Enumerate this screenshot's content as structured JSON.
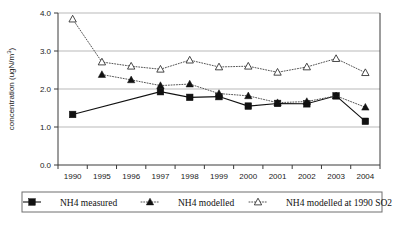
{
  "chart_data": {
    "type": "line",
    "title": "",
    "xlabel": "",
    "ylabel": "concentration (ugN/m",
    "ylabel_sup": "3",
    "ylabel_tail": ")",
    "categories": [
      "1990",
      "1995",
      "1996",
      "1997",
      "1998",
      "1999",
      "2000",
      "2001",
      "2002",
      "2003",
      "2004"
    ],
    "ylim": [
      0.0,
      4.0
    ],
    "yticks": [
      0.0,
      1.0,
      2.0,
      3.0,
      4.0
    ],
    "ytick_labels": [
      "0.0",
      "1.0",
      "2.0",
      "3.0",
      "4.0"
    ],
    "grid": true,
    "legend_position": "bottom",
    "series": [
      {
        "name": "NH4 measured",
        "marker": "filled-square",
        "line": "solid",
        "color": "#111111",
        "values": [
          1.33,
          null,
          null,
          1.93,
          1.78,
          1.8,
          1.55,
          1.62,
          1.61,
          1.82,
          1.15
        ]
      },
      {
        "name": "NH4 modelled",
        "marker": "filled-triangle",
        "line": "dotted",
        "color": "#111111",
        "values": [
          null,
          2.38,
          2.24,
          2.09,
          2.13,
          1.88,
          1.82,
          1.64,
          1.67,
          1.82,
          1.52
        ]
      },
      {
        "name": "NH4 modelled at 1990 SO2",
        "marker": "open-triangle",
        "line": "dotted",
        "color": "#333333",
        "values": [
          3.84,
          2.71,
          2.6,
          2.52,
          2.76,
          2.58,
          2.6,
          2.44,
          2.58,
          2.8,
          2.43
        ]
      }
    ]
  }
}
